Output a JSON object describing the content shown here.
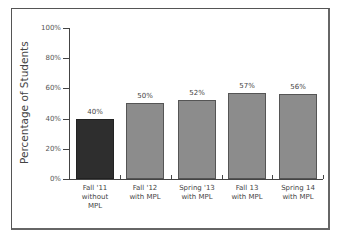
{
  "chart_data": {
    "type": "bar",
    "title": "",
    "xlabel": "",
    "ylabel": "Percentage of Students",
    "ylim": [
      0,
      100
    ],
    "yticks": [
      "0%",
      "20%",
      "40%",
      "60%",
      "80%",
      "100%"
    ],
    "categories": [
      "Fall '11 without MPL",
      "Fall '12 with MPL",
      "Spring '13 with MPL",
      "Fall 13 with MPL",
      "Spring 14 with MPL"
    ],
    "category_lines": [
      [
        "Fall '11",
        "without",
        "MPL"
      ],
      [
        "Fall '12",
        "with MPL"
      ],
      [
        "Spring '13",
        "with MPL"
      ],
      [
        "Fall 13",
        "with MPL"
      ],
      [
        "Spring 14",
        "with MPL"
      ]
    ],
    "values": [
      40,
      50,
      52,
      57,
      56
    ],
    "value_labels": [
      "40%",
      "50%",
      "52%",
      "57%",
      "56%"
    ],
    "colors": [
      "#2e2e2e",
      "#8c8c8c",
      "#8c8c8c",
      "#8c8c8c",
      "#8c8c8c"
    ],
    "grid": false,
    "legend": null
  }
}
